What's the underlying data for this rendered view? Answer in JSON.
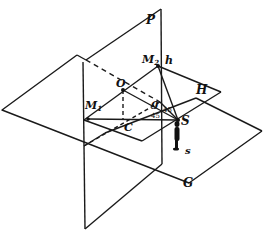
{
  "figure": {
    "colors": {
      "stroke": "#1a1a1a",
      "background": "#ffffff"
    }
  },
  "labels": {
    "P": "P",
    "H": "H",
    "G": "G",
    "h": "h",
    "M2": "M",
    "M2_sub": "2",
    "M1": "M",
    "M1_sub": "1",
    "O": "O",
    "C": "C",
    "g": "g",
    "S": "S",
    "s": "s",
    "angle1": "45",
    "angle2": "45",
    "angle3": "45"
  }
}
